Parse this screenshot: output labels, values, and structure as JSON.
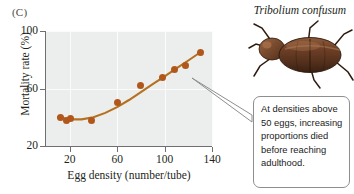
{
  "figure": {
    "panel_label": "(C)",
    "species_caption": "Tribolium confusum",
    "beetle_icon": "beetle-illustration",
    "point_color": "#b1571b",
    "line_color": "#b5711f",
    "plot_background": "#eceded",
    "gridline_color": "#fbfbfb",
    "axis_color": "#6f6f6f"
  },
  "callout": {
    "text": "At densities above 50 eggs, increasing proportions died before reaching adulthood.",
    "border_color": "#8e8e8e",
    "background": "#ffffff"
  },
  "chart_data": {
    "type": "scatter",
    "title": "",
    "xlabel": "Egg density (number/tube)",
    "ylabel": "Mortality rate (%)",
    "xlim": [
      0,
      140
    ],
    "ylim": [
      20,
      100
    ],
    "xticks": [
      20,
      60,
      100,
      140
    ],
    "yticks": [
      20,
      60,
      100
    ],
    "grid": true,
    "legend": "none",
    "series": [
      {
        "name": "Observed mortality",
        "marker": "filled-circle",
        "x": [
          12,
          17,
          21,
          38,
          60,
          80,
          98,
          108,
          118,
          130
        ],
        "y": [
          40,
          38,
          39,
          38,
          50,
          62,
          68,
          73,
          76,
          85
        ]
      },
      {
        "name": "Fitted curve",
        "marker": "line",
        "x": [
          10,
          20,
          30,
          40,
          50,
          60,
          70,
          80,
          90,
          100,
          110,
          120,
          128
        ],
        "y": [
          40,
          38.5,
          38.5,
          40,
          43,
          47,
          52,
          57.5,
          63,
          68.5,
          74,
          79.5,
          84
        ]
      }
    ]
  }
}
